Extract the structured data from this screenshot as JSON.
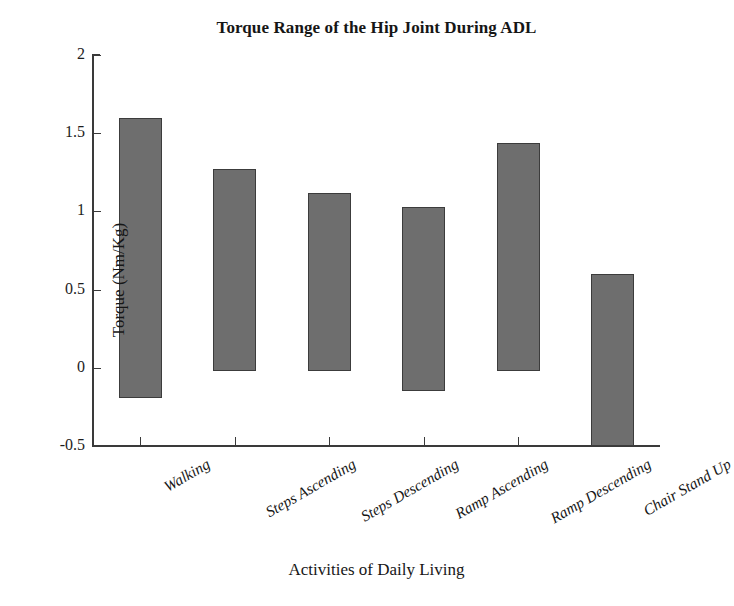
{
  "chart_data": {
    "type": "bar",
    "title": "Torque Range of the Hip Joint During ADL",
    "xlabel": "Activities of Daily Living",
    "ylabel": "Torque (Nm/Kg)",
    "categories": [
      "Walking",
      "Steps Ascending",
      "Steps Descending",
      "Ramp Ascending",
      "Ramp Descending",
      "Chair Stand Up"
    ],
    "series": [
      {
        "name": "Torque range (min to max)",
        "bar_min": [
          -0.19,
          -0.02,
          -0.02,
          -0.15,
          -0.02,
          -0.5
        ],
        "bar_max": [
          1.6,
          1.27,
          1.12,
          1.03,
          1.44,
          0.6
        ]
      }
    ],
    "values": [
      1.79,
      1.29,
      1.14,
      1.18,
      1.46,
      1.1
    ],
    "ylim": [
      -0.5,
      2
    ],
    "yticks": [
      "2",
      "1.5",
      "1",
      "0.5",
      "0",
      "-0.5"
    ],
    "ytick_values": [
      2,
      1.5,
      1,
      0.5,
      0,
      -0.5
    ],
    "grid": false,
    "legend": "none",
    "bar_color": "#6e6e6e",
    "bar_edge_color": "#3c3c3c",
    "axis_color": "#3a3a3a"
  }
}
